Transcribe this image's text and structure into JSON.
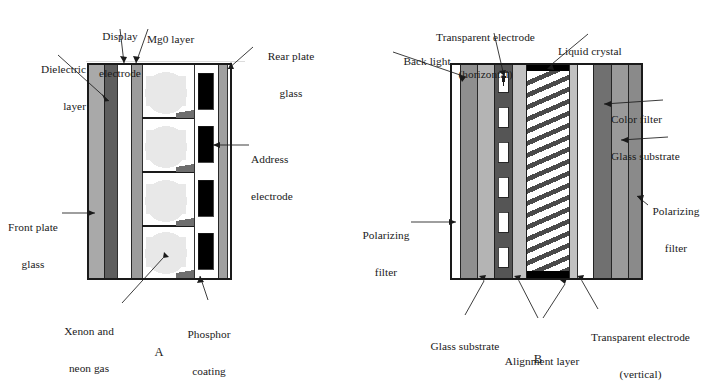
{
  "figure": {
    "type": "technical-cross-section-diagram",
    "panels": [
      {
        "id": "A",
        "letter": "A",
        "name": "plasma-display-panel",
        "labels": [
          {
            "name": "dielectric-layer",
            "text": "Dielectric\nlayer",
            "line1": "Dielectric",
            "line2": "layer"
          },
          {
            "name": "display-electrode",
            "text": "Display\nelectrode",
            "line1": "Display",
            "line2": "electrode"
          },
          {
            "name": "mgo-layer",
            "text": "Mg0 layer",
            "line1": "Mg0 layer",
            "line2": ""
          },
          {
            "name": "rear-plate-glass",
            "text": "Rear plate\nglass",
            "line1": "Rear plate",
            "line2": "glass"
          },
          {
            "name": "address-electrode",
            "text": "Address\nelectrode",
            "line1": "Address",
            "line2": "electrode"
          },
          {
            "name": "front-plate-glass",
            "text": "Front plate\nglass",
            "line1": "Front plate",
            "line2": "glass"
          },
          {
            "name": "xenon-neon-gas",
            "text": "Xenon and\nneon gas",
            "line1": "Xenon and",
            "line2": "neon gas"
          },
          {
            "name": "phosphor-coating",
            "text": "Phosphor\ncoating",
            "line1": "Phosphor",
            "line2": "coating"
          }
        ],
        "layers": [
          {
            "name": "front-plate-glass",
            "fill": "#a9a9a9"
          },
          {
            "name": "dielectric-layer",
            "fill": "#5e5e5e"
          },
          {
            "name": "display-electrode",
            "fill": "#ffffff"
          },
          {
            "name": "mgo-layer",
            "fill": "#9c9c9c"
          },
          {
            "name": "discharge-cell-gas",
            "fill": "#ffffff"
          },
          {
            "name": "gas-glow",
            "fill": "#e2e2e2"
          },
          {
            "name": "barrier-rib",
            "fill": "#6e6e6e"
          },
          {
            "name": "phosphor-coating",
            "fill": "#ffffff"
          },
          {
            "name": "address-electrode",
            "fill": "#000000"
          },
          {
            "name": "rear-plate-glass",
            "fill": "#a0a0a0"
          }
        ],
        "cell_count": 4,
        "address_electrode_count": 4
      },
      {
        "id": "B",
        "letter": "B",
        "name": "lcd-display-panel",
        "labels": [
          {
            "name": "back-light",
            "text": "Back light",
            "line1": "Back light",
            "line2": ""
          },
          {
            "name": "transparent-electrode-horizontal",
            "text": "Transparent electrode\n(horizontal)",
            "line1": "Transparent electrode",
            "line2": "(horizontal)"
          },
          {
            "name": "liquid-crystal",
            "text": "Liquid crystal",
            "line1": "Liquid crystal",
            "line2": ""
          },
          {
            "name": "color-filter",
            "text": "Color filter",
            "line1": "Color filter",
            "line2": ""
          },
          {
            "name": "glass-substrate-right",
            "text": "Glass substrate",
            "line1": "Glass substrate",
            "line2": ""
          },
          {
            "name": "polarizing-filter-left",
            "text": "Polarizing\nfilter",
            "line1": "Polarizing",
            "line2": "filter"
          },
          {
            "name": "polarizing-filter-right",
            "text": "Polarizing\nfilter",
            "line1": "Polarizing",
            "line2": "filter"
          },
          {
            "name": "glass-substrate-left",
            "text": "Glass substrate",
            "line1": "Glass substrate",
            "line2": ""
          },
          {
            "name": "alignment-layer",
            "text": "Alignment layer",
            "line1": "Alignment layer",
            "line2": ""
          },
          {
            "name": "transparent-electrode-vertical",
            "text": "Transparent electrode\n(vertical)",
            "line1": "Transparent electrode",
            "line2": "(vertical)"
          }
        ],
        "layers": [
          {
            "name": "back-light",
            "fill": "#ffffff"
          },
          {
            "name": "polarizing-filter-left",
            "fill": "#8f8f8f"
          },
          {
            "name": "glass-substrate-left",
            "fill": "#b4b4b4"
          },
          {
            "name": "transparent-electrode-horizontal",
            "fill": "#555555"
          },
          {
            "name": "electrode-window",
            "fill": "#ffffff"
          },
          {
            "name": "alignment-layer",
            "fill": "#c2c2c2"
          },
          {
            "name": "liquid-crystal",
            "fill": "#ffffff"
          },
          {
            "name": "liquid-crystal-hatch",
            "fill": "#4a4a4a"
          },
          {
            "name": "alignment-layer-bar",
            "fill": "#000000"
          },
          {
            "name": "transparent-electrode-vertical",
            "fill": "#b9b9b9"
          },
          {
            "name": "color-filter",
            "fill": "#707070"
          },
          {
            "name": "glass-substrate-right",
            "fill": "#9a9a9a"
          },
          {
            "name": "polarizing-filter-right",
            "fill": "#8a8a8a"
          }
        ],
        "electrode_window_count": 6,
        "hatch_line_count": 17
      }
    ],
    "colors": {
      "stroke": "#1a1a1a",
      "text": "#1a1a1a",
      "background": "#ffffff"
    }
  }
}
